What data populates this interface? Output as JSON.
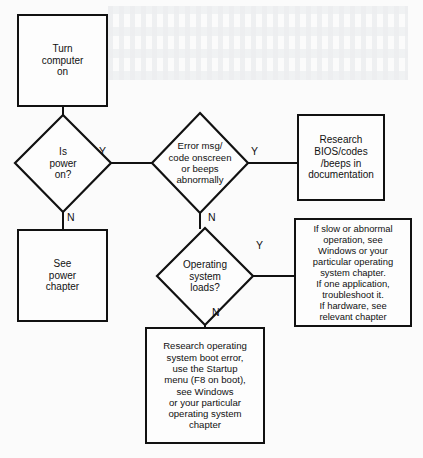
{
  "diagram": {
    "type": "flowchart",
    "stroke_color": "#111111",
    "background_color": "#fbfbfb",
    "nodes": {
      "turn_computer_on": {
        "shape": "process",
        "text": "Turn\ncomputer\non"
      },
      "is_power_on": {
        "shape": "decision",
        "text": "Is\npower\non?"
      },
      "see_power_chapter": {
        "shape": "process",
        "text": "See\npower\nchapter"
      },
      "error_msg": {
        "shape": "decision",
        "text": "Error msg/\ncode onscreen\nor beeps\nabnormally"
      },
      "research_bios": {
        "shape": "process",
        "text": "Research\nBIOS/codes\n/beeps in\ndocumentation"
      },
      "os_loads": {
        "shape": "decision",
        "text": "Operating\nsystem\nloads?"
      },
      "slow_abnormal": {
        "shape": "process",
        "text": "If slow or abnormal\noperation,  see\nWindows or your\nparticular operating\nsystem chapter.\nIf one application,\ntroubleshoot it.\nIf hardware, see\nrelevant chapter"
      },
      "research_os_boot": {
        "shape": "process",
        "text": "Research operating\nsystem boot error,\nuse the Startup\nmenu (F8 on boot),\nsee Windows\nor your particular\noperating system\nchapter"
      }
    },
    "branch_labels": {
      "power_yes": "Y",
      "power_no": "N",
      "error_yes": "Y",
      "error_no": "N",
      "os_yes": "Y",
      "os_no": "N"
    }
  }
}
